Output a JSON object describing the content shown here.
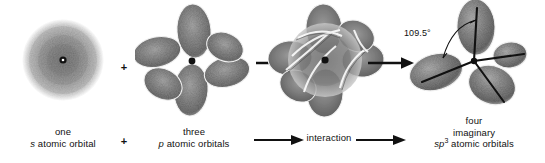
{
  "figure": {
    "background_color": "#ffffff",
    "ink_color": "#1a1a1a"
  },
  "steps": [
    {
      "id": "s-orbital",
      "icon": "s-atomic-orbital",
      "caption_line1": "one",
      "caption_line2_italic": "s",
      "caption_line2_rest": " atomic orbital"
    },
    {
      "id": "p-orbitals",
      "icon": "three-p-atomic-orbitals",
      "caption_line1": "three",
      "caption_line2_italic": "p",
      "caption_line2_rest": " atomic orbitals"
    },
    {
      "id": "interaction",
      "icon": "interaction-orbital-overlap",
      "caption_line1": "interaction"
    },
    {
      "id": "sp3-orbitals",
      "icon": "four-sp3-hybrid-orbitals",
      "caption_line1": "four",
      "caption_line2": "imaginary",
      "caption_line3_prefix": "sp",
      "caption_line3_sup": "3",
      "caption_line3_rest": " atomic orbitals"
    }
  ],
  "operators": {
    "plus_top": "+",
    "plus_bottom": "+",
    "arrow": "arrow-right-icon"
  },
  "annotations": {
    "bond_angle": "109.5°"
  }
}
